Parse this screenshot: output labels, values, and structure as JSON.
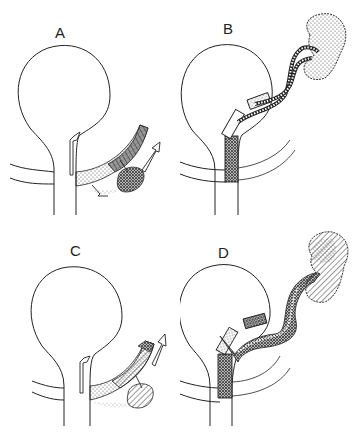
{
  "figure": {
    "type": "anatomical schematic",
    "panels": [
      {
        "id": "A",
        "label": "A",
        "description": "Spherical chamber with stem; curved shaded band at the right base with up-arrow on stem and diverging arrows"
      },
      {
        "id": "B",
        "label": "B",
        "description": "Chamber with dense-stippled block on stem; tubes extend diagonally up-right to a lobed stippled mass"
      },
      {
        "id": "C",
        "label": "C",
        "description": "Like A with hatched lobe; up-arrow on stem and up-right arrow at band end"
      },
      {
        "id": "D",
        "label": "D",
        "description": "Like B with wavy tubes to a hatched lobed mass at upper right"
      }
    ],
    "colors": {
      "line": "#222222",
      "background": "#ffffff",
      "stipple": "#555555"
    }
  }
}
